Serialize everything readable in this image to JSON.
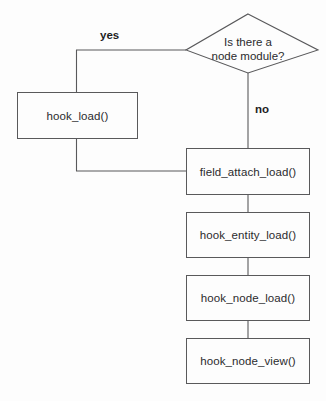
{
  "diagram": {
    "background_color": "#fdfdfd",
    "stroke_color": "#59595b",
    "text_color": "#2b2b2d",
    "decision": {
      "line1": "Is there a",
      "line2": "node module?"
    },
    "labels": {
      "yes": "yes",
      "no": "no"
    },
    "boxes": [
      {
        "id": "hook-load",
        "label": "hook_load()"
      },
      {
        "id": "field-attach-load",
        "label": "field_attach_load()"
      },
      {
        "id": "hook-entity-load",
        "label": "hook_entity_load()"
      },
      {
        "id": "hook-node-load",
        "label": "hook_node_load()"
      },
      {
        "id": "hook-node-view",
        "label": "hook_node_view()"
      }
    ]
  }
}
